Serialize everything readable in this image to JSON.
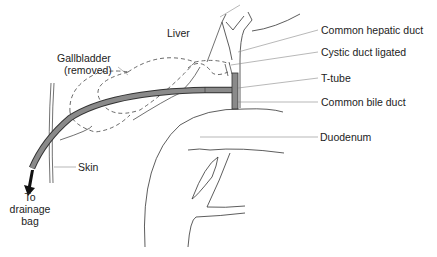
{
  "figure": {
    "colors": {
      "line": "#333333",
      "tube_fill": "#8a8a8a",
      "leader": "#888888",
      "arrow": "#111111"
    }
  },
  "labels": {
    "liver": "Liver",
    "gallbladder_line1": "Gallbladder",
    "gallbladder_line2": "(removed)",
    "common_hepatic_duct": "Common hepatic duct",
    "cystic_duct": "Cystic duct ligated",
    "t_tube": "T-tube",
    "common_bile_duct": "Common bile duct",
    "duodenum": "Duodenum",
    "skin": "Skin",
    "drain_line1": "To",
    "drain_line2": "drainage",
    "drain_line3": "bag"
  }
}
